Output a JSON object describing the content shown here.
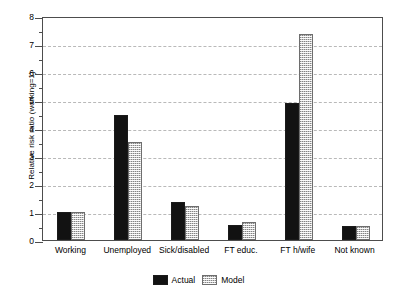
{
  "chart_data": {
    "type": "bar",
    "title": "",
    "xlabel": "",
    "ylabel": "Relative risk ratio (working=1)",
    "ylim": [
      0,
      8
    ],
    "yticks": [
      0,
      1,
      2,
      3,
      4,
      5,
      6,
      7,
      8
    ],
    "ytick_labels": [
      "0",
      "1",
      "2",
      "3",
      "4",
      "5",
      "6",
      "7",
      "8"
    ],
    "grid": true,
    "grid_axis": "y",
    "legend_position": "bottom-center",
    "categories": [
      "Working",
      "Unemployed",
      "Sick/disabled",
      "FT educ.",
      "FT h/wife",
      "Not known"
    ],
    "series": [
      {
        "name": "Actual",
        "color": "#121212",
        "values": [
          1.0,
          4.45,
          1.35,
          0.52,
          4.9,
          0.5
        ]
      },
      {
        "name": "Model",
        "color": "#c9c9c9",
        "values": [
          1.0,
          3.5,
          1.2,
          0.63,
          7.35,
          0.5
        ]
      }
    ]
  },
  "legend": {
    "entries": [
      {
        "label": "Actual"
      },
      {
        "label": "Model"
      }
    ]
  }
}
